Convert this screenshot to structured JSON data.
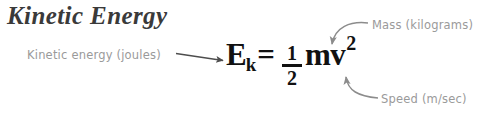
{
  "figure": {
    "title": "Kinetic Energy",
    "background_color": "#ffffff",
    "title_color": "#3a3a3a",
    "annotation_color": "#9a9a9a",
    "formula_color": "#111111",
    "arrow_color": "#8c8c8c",
    "pointer_arrow_color": "#4d4d4d"
  },
  "formula": {
    "variable": "E",
    "subscript": "k",
    "equals": "=",
    "fraction_numerator": "1",
    "fraction_denominator": "2",
    "mass_velocity": "mv",
    "exponent": "2",
    "plain_text": "Ek = 1/2 mv2"
  },
  "annotations": {
    "energy": "Kinetic energy (joules)",
    "mass": "Mass (kilograms)",
    "speed": "Speed (m/sec)"
  }
}
